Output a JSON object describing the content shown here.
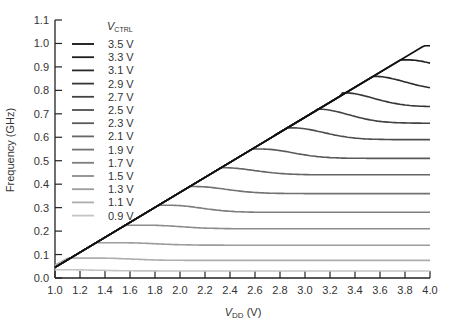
{
  "chart_data": {
    "type": "line",
    "title": "",
    "xlabel": "V_DD (V)",
    "xlabel_main": "V",
    "xlabel_sub": "DD",
    "xlabel_unit": " (V)",
    "ylabel": "Frequency (GHz)",
    "xlim": [
      1.0,
      4.0
    ],
    "ylim": [
      0.0,
      1.1
    ],
    "xticks": [
      "1.0",
      "1.2",
      "1.4",
      "1.6",
      "1.8",
      "2.0",
      "2.2",
      "2.4",
      "2.6",
      "2.8",
      "3.0",
      "3.2",
      "3.4",
      "3.6",
      "3.8",
      "4.0"
    ],
    "yticks": [
      "0.0",
      "0.1",
      "0.2",
      "0.3",
      "0.4",
      "0.5",
      "0.6",
      "0.7",
      "0.8",
      "0.9",
      "1.0",
      "1.1"
    ],
    "legend_title_main": "V",
    "legend_title_sub": "CTRL",
    "legend_position": "upper-left",
    "grid": false,
    "series": [
      {
        "name": "3.5 V",
        "color": "#111111",
        "peak_x": 4.0,
        "peak_y": 0.99,
        "plateau": 0.99
      },
      {
        "name": "3.3 V",
        "color": "#1e1e1e",
        "peak_x": 3.82,
        "peak_y": 0.93,
        "plateau": 0.87
      },
      {
        "name": "3.1 V",
        "color": "#2a2a2a",
        "peak_x": 3.55,
        "peak_y": 0.86,
        "plateau": 0.8
      },
      {
        "name": "2.9 V",
        "color": "#363636",
        "peak_x": 3.3,
        "peak_y": 0.79,
        "plateau": 0.73
      },
      {
        "name": "2.7 V",
        "color": "#424242",
        "peak_x": 3.1,
        "peak_y": 0.72,
        "plateau": 0.66
      },
      {
        "name": "2.5 V",
        "color": "#4e4e4e",
        "peak_x": 2.9,
        "peak_y": 0.64,
        "plateau": 0.59
      },
      {
        "name": "2.3 V",
        "color": "#5a5a5a",
        "peak_x": 2.65,
        "peak_y": 0.55,
        "plateau": 0.51
      },
      {
        "name": "2.1 V",
        "color": "#666666",
        "peak_x": 2.35,
        "peak_y": 0.47,
        "plateau": 0.44
      },
      {
        "name": "1.9 V",
        "color": "#727272",
        "peak_x": 2.12,
        "peak_y": 0.39,
        "plateau": 0.36
      },
      {
        "name": "1.7 V",
        "color": "#7e7e7e",
        "peak_x": 1.92,
        "peak_y": 0.31,
        "plateau": 0.28
      },
      {
        "name": "1.5 V",
        "color": "#8c8c8c",
        "peak_x": 1.75,
        "peak_y": 0.225,
        "plateau": 0.21
      },
      {
        "name": "1.3 V",
        "color": "#9c9c9c",
        "peak_x": 1.55,
        "peak_y": 0.15,
        "plateau": 0.14
      },
      {
        "name": "1.1 V",
        "color": "#adadad",
        "peak_x": 1.35,
        "peak_y": 0.085,
        "plateau": 0.075
      },
      {
        "name": "0.9 V",
        "color": "#c4c4c4",
        "peak_x": 1.1,
        "peak_y": 0.035,
        "plateau": 0.03
      }
    ],
    "envelope": {
      "x0": 1.0,
      "y0": 0.045,
      "slope": 0.32
    }
  }
}
